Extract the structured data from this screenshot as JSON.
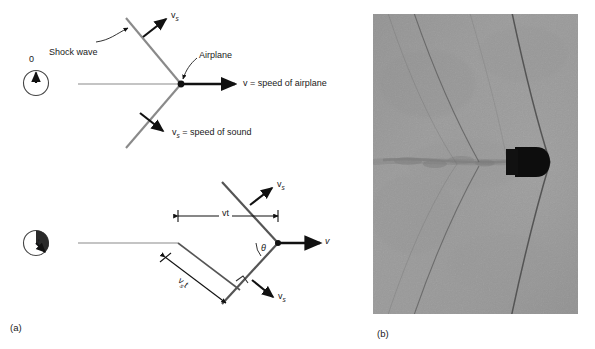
{
  "figure": {
    "panels": [
      {
        "letter": "(a)",
        "kind": "diagram"
      },
      {
        "letter": "(b)",
        "kind": "photograph"
      }
    ]
  },
  "panel_a": {
    "diagram_top": {
      "clock_label": "0",
      "shock_wave_label": "Shock wave",
      "airplane_label": "Airplane",
      "velocity_label_v": "v",
      "velocity_label_v_rest": " = speed of airplane",
      "sound_label_v": "v",
      "sound_label_sub": "s",
      "sound_label_rest": " = speed of sound",
      "wavefront_vector_v": "v",
      "wavefront_vector_sub": "s",
      "lower_vector_v": "v",
      "lower_vector_sub": "s"
    },
    "diagram_bottom": {
      "clock_label": "t",
      "dimension_vt_v": "v",
      "dimension_vt_t": "t",
      "dimension_vst_v": "v",
      "dimension_vst_sub": "s",
      "dimension_vst_t": "t",
      "angle_label": "θ",
      "velocity_label": "v",
      "upper_vector_v": "v",
      "upper_vector_sub": "s",
      "lower_vector_v": "v",
      "lower_vector_sub": "s"
    }
  },
  "panel_b": {
    "caption_letter": "(b)",
    "subject": "supersonic-bullet-schlieren-photograph",
    "background_color": "#9a9a9a",
    "bullet_color": "#0d0d0d"
  },
  "colors": {
    "line": "#7a7a7a",
    "arrow": "#111111",
    "text": "#1a1a1a",
    "photo_bg": "#9a9a9a"
  }
}
